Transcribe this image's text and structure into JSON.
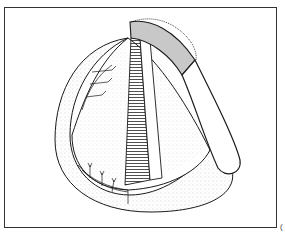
{
  "figure": {
    "corner_mark": "(",
    "colors": {
      "stroke": "#1a1a1a",
      "pedicle_shade": "#c8c8c8",
      "stipple": "#bdbdbd"
    },
    "elements": [
      "outer-rim",
      "inner-cone",
      "striated-strip",
      "pedicle-band",
      "suture-lines-upper",
      "suture-lines-lower"
    ]
  }
}
